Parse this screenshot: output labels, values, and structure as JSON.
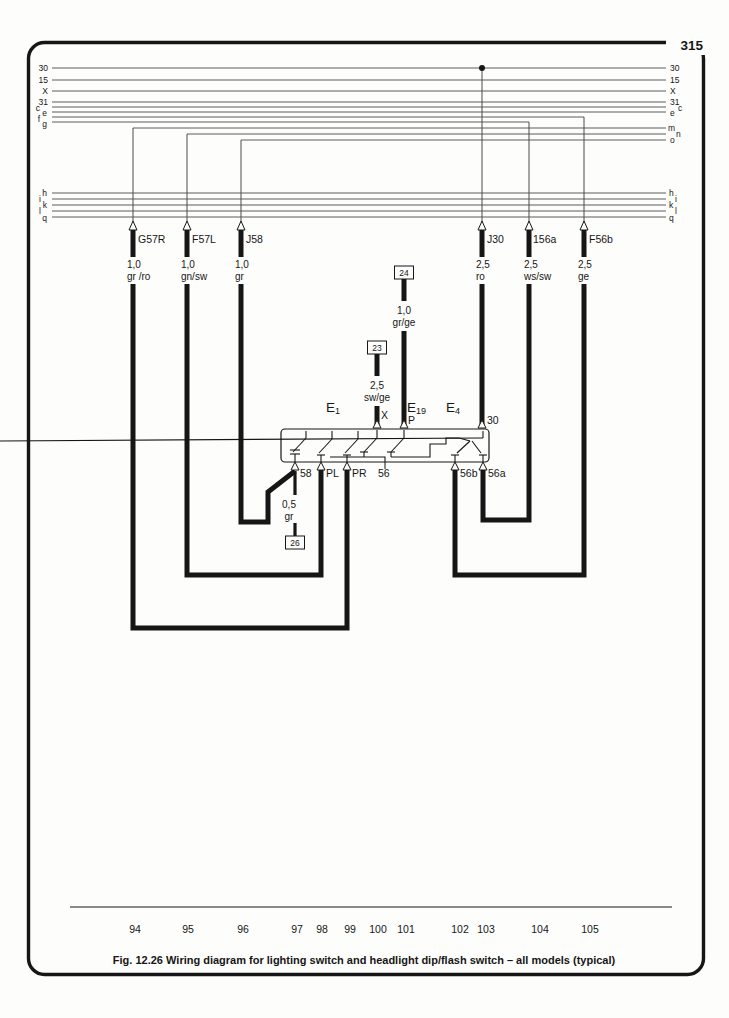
{
  "page": {
    "number": "315",
    "caption": "Fig. 12.26 Wiring diagram for lighting switch and headlight dip/flash switch – all models (typical)"
  },
  "rails": {
    "left_upper": [
      "30",
      "15",
      "X",
      "31",
      "c",
      "e",
      "f",
      "g"
    ],
    "right_upper": [
      "30",
      "15",
      "X",
      "31",
      "c",
      "e",
      "m",
      "n",
      "o"
    ],
    "left_lower": [
      "h",
      "i",
      "k",
      "l",
      "q"
    ],
    "right_lower": [
      "h",
      "i",
      "k",
      "l",
      "q"
    ]
  },
  "connectors": [
    {
      "name": "G57R",
      "size": "1,0",
      "color": "gr /ro"
    },
    {
      "name": "F57L",
      "size": "1,0",
      "color": "gn/sw"
    },
    {
      "name": "J58",
      "size": "1,0",
      "color": "gr"
    },
    {
      "name": "J30",
      "size": "2,5",
      "color": "ro"
    },
    {
      "name": "156a",
      "size": "2,5",
      "color": "ws/sw"
    },
    {
      "name": "F56b",
      "size": "2,5",
      "color": "ge"
    }
  ],
  "mid_wires": {
    "w24": {
      "ref": "24",
      "size": "1,0",
      "color": "gr/ge"
    },
    "w23": {
      "ref": "23",
      "size": "2,5",
      "color": "sw/ge"
    },
    "w26": {
      "ref": "26",
      "size": "0,5",
      "color": "gr"
    }
  },
  "switch": {
    "e1_base": "E",
    "e1_sub": "1",
    "e19_base": "E",
    "e19_sub": "19",
    "e4_base": "E",
    "e4_sub": "4",
    "terminal_x": "X",
    "terminal_p": "P",
    "terminal_30": "30",
    "bottom_terminals": [
      "58",
      "PL",
      "PR",
      "56",
      "56b",
      "56a"
    ]
  },
  "tracks": [
    "94",
    "95",
    "96",
    "97",
    "98",
    "99",
    "100",
    "101",
    "102",
    "103",
    "104",
    "105"
  ],
  "colors": {
    "line": "#1b1b1b",
    "rail": "#4a4a4a",
    "bg": "#fdfdfc"
  }
}
